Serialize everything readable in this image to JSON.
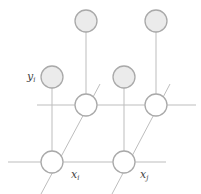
{
  "diagram": {
    "title": "",
    "colors": {
      "edge": "#bdbdbd",
      "node_stroke": "#a9a9a9",
      "observed_fill": "#ebebeb",
      "hidden_fill": "#ffffff",
      "label": "#444444"
    },
    "labels": {
      "y_i": {
        "base": "y",
        "sub": "i"
      },
      "x_i": {
        "base": "x",
        "sub": "i"
      },
      "x_j": {
        "base": "x",
        "sub": "j"
      }
    },
    "nodes": [
      {
        "id": "top-observed-1",
        "type": "observed",
        "cx": 86,
        "cy": 21,
        "r": 11
      },
      {
        "id": "top-observed-2",
        "type": "observed",
        "cx": 156,
        "cy": 21,
        "r": 11
      },
      {
        "id": "y_i",
        "type": "observed",
        "cx": 52,
        "cy": 77,
        "r": 11
      },
      {
        "id": "mid-observed",
        "type": "observed",
        "cx": 124,
        "cy": 77,
        "r": 11
      },
      {
        "id": "upper-hidden-1",
        "type": "hidden",
        "cx": 86,
        "cy": 105,
        "r": 11
      },
      {
        "id": "upper-hidden-2",
        "type": "hidden",
        "cx": 156,
        "cy": 105,
        "r": 11
      },
      {
        "id": "x_i",
        "type": "hidden",
        "cx": 52,
        "cy": 162,
        "r": 11
      },
      {
        "id": "x_j",
        "type": "hidden",
        "cx": 124,
        "cy": 162,
        "r": 11
      }
    ],
    "edges": [
      {
        "id": "upper-horizontal",
        "x1": 37,
        "y1": 105,
        "x2": 196,
        "y2": 105
      },
      {
        "id": "lower-horizontal",
        "x1": 8,
        "y1": 162,
        "x2": 166,
        "y2": 162
      },
      {
        "id": "top1-vertical",
        "x1": 86,
        "y1": 32,
        "x2": 86,
        "y2": 94
      },
      {
        "id": "top2-vertical",
        "x1": 156,
        "y1": 32,
        "x2": 156,
        "y2": 94
      },
      {
        "id": "yi-vertical",
        "x1": 52,
        "y1": 88,
        "x2": 52,
        "y2": 151
      },
      {
        "id": "mid-vertical",
        "x1": 124,
        "y1": 88,
        "x2": 124,
        "y2": 151
      },
      {
        "id": "left-diagonal",
        "x1": 41,
        "y1": 194,
        "x2": 100,
        "y2": 84
      },
      {
        "id": "right-diagonal",
        "x1": 112,
        "y1": 194,
        "x2": 170,
        "y2": 84
      }
    ]
  }
}
